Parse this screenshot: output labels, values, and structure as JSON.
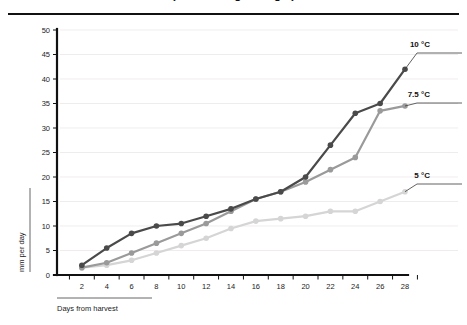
{
  "figure": {
    "title_partial": "(  rate during storage  )",
    "has_top_rule": true
  },
  "axes": {
    "y_title": "mm per day",
    "x_title": "Days from harvest",
    "y_ticks": [
      0,
      5,
      10,
      15,
      20,
      25,
      30,
      35,
      40,
      45,
      50
    ],
    "x_ticks": [
      2,
      4,
      6,
      8,
      10,
      12,
      14,
      16,
      18,
      20,
      22,
      24,
      26,
      28
    ]
  },
  "colors": {
    "series_10c": "#4a4a4a",
    "series_75c": "#9a9a9a",
    "series_5c": "#d5d5d5",
    "grid": "#e9e4e4",
    "axis": "#111111",
    "background": "#ffffff"
  },
  "annotations": [
    {
      "name": "label-10c",
      "text": "10 °C",
      "x": 430,
      "y": 47
    },
    {
      "name": "label-75c",
      "text": "7.5 °C",
      "x": 430,
      "y": 97
    },
    {
      "name": "label-5c",
      "text": "5 °C",
      "x": 430,
      "y": 178
    }
  ],
  "chart_data": {
    "type": "line",
    "title": "(  rate during storage  )",
    "xlabel": "Days from harvest",
    "ylabel": "mm per day",
    "xlim": [
      0,
      29
    ],
    "ylim": [
      0,
      50
    ],
    "grid": true,
    "legend_position": "right-annotations",
    "x": [
      2,
      4,
      6,
      8,
      10,
      12,
      14,
      16,
      18,
      20,
      22,
      24,
      26,
      28
    ],
    "series": [
      {
        "name": "10 °C",
        "color": "#4a4a4a",
        "values": [
          2.0,
          5.5,
          8.5,
          10.0,
          10.5,
          12.0,
          13.5,
          15.5,
          17.0,
          20.0,
          26.5,
          33.0,
          35.0,
          42.0
        ]
      },
      {
        "name": "7.5 °C",
        "color": "#9a9a9a",
        "values": [
          1.5,
          2.5,
          4.5,
          6.5,
          8.5,
          10.5,
          13.0,
          15.5,
          17.0,
          19.0,
          21.5,
          24.0,
          33.5,
          34.5
        ]
      },
      {
        "name": "5 °C",
        "color": "#d5d5d5",
        "values": [
          1.5,
          2.0,
          3.0,
          4.5,
          6.0,
          7.5,
          9.5,
          11.0,
          11.5,
          12.0,
          13.0,
          13.0,
          15.0,
          17.0
        ]
      }
    ]
  }
}
